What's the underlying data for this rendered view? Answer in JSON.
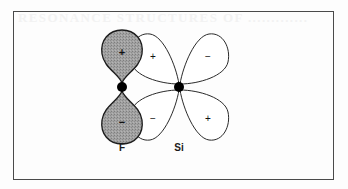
{
  "figure": {
    "background_color": "#fdfdfd",
    "frame_color": "#4a4a4a",
    "bleed_through_text": "RESONANCE STRUCTURES OF ............."
  },
  "palette": {
    "shaded_lobe_fill": "#9a9a9a",
    "shaded_lobe_stroke": "#1c1c1c",
    "open_lobe_fill": "#ffffff",
    "open_lobe_stroke": "#2a2a2a",
    "nucleus_color": "#000000",
    "sign_color": "#111111",
    "label_color": "#1a1a1a"
  },
  "atoms": [
    {
      "id": "f",
      "label": "F",
      "nucleus": {
        "cx": 122,
        "cy": 87,
        "r": 5
      },
      "label_pos": {
        "x": 122,
        "y": 142
      }
    },
    {
      "id": "si",
      "label": "Si",
      "nucleus": {
        "cx": 179,
        "cy": 87,
        "r": 5
      },
      "label_pos": {
        "x": 179,
        "y": 142
      }
    }
  ],
  "lobes": [
    {
      "id": "f-upper",
      "atom": "f",
      "style": "shaded",
      "sign": "+",
      "sign_pos": {
        "x": 122,
        "y": 52
      },
      "direction": "up"
    },
    {
      "id": "f-lower",
      "atom": "f",
      "style": "shaded",
      "sign": "−",
      "sign_pos": {
        "x": 122,
        "y": 122
      },
      "direction": "down"
    },
    {
      "id": "si-upper-left",
      "atom": "si",
      "style": "open",
      "sign": "+",
      "sign_pos": {
        "x": 153,
        "y": 56
      },
      "direction": "up-left"
    },
    {
      "id": "si-upper-right",
      "atom": "si",
      "style": "open",
      "sign": "−",
      "sign_pos": {
        "x": 208,
        "y": 56
      },
      "direction": "up-right"
    },
    {
      "id": "si-lower-left",
      "atom": "si",
      "style": "open",
      "sign": "−",
      "sign_pos": {
        "x": 153,
        "y": 118
      },
      "direction": "down-left"
    },
    {
      "id": "si-lower-right",
      "atom": "si",
      "style": "open",
      "sign": "+",
      "sign_pos": {
        "x": 208,
        "y": 118
      },
      "direction": "down-right"
    }
  ]
}
